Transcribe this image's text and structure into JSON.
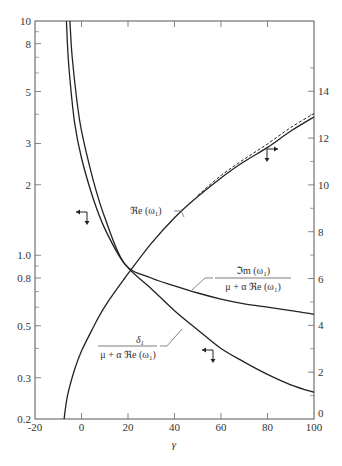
{
  "chart_data": {
    "type": "line",
    "title": "",
    "xlabel": "γ",
    "ylabel_left": "",
    "ylabel_right": "",
    "xlim": [
      -20,
      100
    ],
    "ylim_left": [
      0.2,
      10
    ],
    "yscale_left": "log",
    "ylim_right": [
      0,
      17
    ],
    "yscale_right": "linear",
    "grid": false,
    "legend": "none (curves labeled inline)",
    "x_ticks": [
      "-20",
      "0",
      "20",
      "40",
      "60",
      "80",
      "100"
    ],
    "y_ticks_left": [
      "0.2",
      "0.3",
      "0.5",
      "0.8",
      "1.0",
      "2",
      "3",
      "5",
      "8",
      "10"
    ],
    "y_ticks_right": [
      "0",
      "2",
      "4",
      "6",
      "8",
      "10",
      "12",
      "14"
    ],
    "series": [
      {
        "name": "Re(ω1)",
        "axis": "right",
        "style": "solid",
        "x": [
          -7.5,
          -6,
          -3,
          0,
          5,
          10,
          18.5,
          30,
          40,
          50,
          60,
          70,
          80,
          90,
          100
        ],
        "values": [
          0,
          1.0,
          2.1,
          2.9,
          3.9,
          4.8,
          6.0,
          7.5,
          8.6,
          9.5,
          10.3,
          11.0,
          11.6,
          12.3,
          12.9
        ]
      },
      {
        "name": "Re(ω1) asymptotic (dashed)",
        "axis": "right",
        "style": "dashed",
        "x": [
          50,
          60,
          70,
          80,
          90,
          100
        ],
        "values": [
          9.55,
          10.4,
          11.1,
          11.75,
          12.45,
          13.05
        ]
      },
      {
        "name": "Im(ω1) / (μ + α Re(ω1))",
        "axis": "left",
        "style": "solid",
        "x": [
          -5,
          -4,
          -2,
          0,
          5,
          10,
          18.5,
          30,
          40,
          50,
          60,
          70,
          80,
          90,
          100
        ],
        "values": [
          10,
          7.0,
          4.6,
          3.4,
          2.1,
          1.45,
          0.92,
          0.8,
          0.74,
          0.69,
          0.65,
          0.62,
          0.6,
          0.58,
          0.56
        ]
      },
      {
        "name": "δ1 / (μ + α Re(ω1))",
        "axis": "left",
        "style": "solid",
        "x": [
          -6.5,
          -5.5,
          -3,
          0,
          5,
          10,
          18.5,
          30,
          40,
          50,
          60,
          70,
          80,
          90,
          100
        ],
        "values": [
          10,
          6.5,
          3.7,
          2.6,
          1.75,
          1.3,
          0.92,
          0.72,
          0.58,
          0.48,
          0.4,
          0.35,
          0.31,
          0.28,
          0.26
        ]
      }
    ],
    "annotations": [
      {
        "text": "ℜe (ω1)",
        "near_x": 30
      },
      {
        "text": "ℑm (ω1) / (μ + α ℜe (ω1))",
        "near_x": 60
      },
      {
        "text": "δ1 / (μ + α ℜe (ω1))",
        "near_x": 30
      },
      {
        "text": "arrow marker left+down (left-axis curves)",
        "near_x": 0
      },
      {
        "text": "arrow marker right+down (right-axis curve)",
        "near_x": 80
      },
      {
        "text": "arrow marker left+down",
        "near_x": 55
      }
    ]
  },
  "labels": {
    "xlabel": "γ",
    "re_label": "ℜe (ω",
    "re_sub": "1",
    "re_close": ")",
    "im_num": "ℑm (ω",
    "im_num_sub": "1",
    "im_num_close": ")",
    "den": "μ + α ℜe (ω",
    "den_sub": "1",
    "den_close": ")",
    "delta_num": "δ",
    "delta_sub": "1",
    "delta_den": "μ + α ℜe (ω",
    "delta_den_sub": "1",
    "delta_den_close": ")"
  }
}
